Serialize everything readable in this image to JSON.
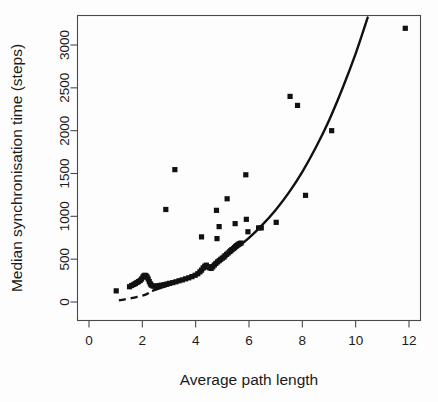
{
  "chart_data": {
    "type": "scatter",
    "title": "",
    "subtitle": "",
    "xlabel": "Average path length",
    "ylabel": "Median synchronisation time (steps)",
    "xlim": [
      0,
      12.6
    ],
    "ylim": [
      -60,
      3380
    ],
    "xticks": [
      0,
      2,
      4,
      6,
      8,
      10,
      12
    ],
    "xticklabels": [
      "0",
      "2",
      "4",
      "6",
      "8",
      "10",
      "12"
    ],
    "yticks": [
      0,
      500,
      1000,
      1500,
      2000,
      2500,
      3000
    ],
    "yticklabels": [
      "0",
      "500",
      "1000",
      "1500",
      "2000",
      "2500",
      "3000"
    ],
    "grid": false,
    "legend": null,
    "marker": "filled-square",
    "marker_color": "#111111",
    "series": [
      {
        "name": "networks",
        "marker": "filled-square",
        "points": [
          [
            1.02,
            130
          ],
          [
            1.52,
            178
          ],
          [
            1.6,
            193
          ],
          [
            1.68,
            205
          ],
          [
            1.74,
            216
          ],
          [
            1.8,
            228
          ],
          [
            1.86,
            238
          ],
          [
            1.92,
            252
          ],
          [
            1.97,
            268
          ],
          [
            2.02,
            290
          ],
          [
            2.06,
            305
          ],
          [
            2.1,
            312
          ],
          [
            2.14,
            305
          ],
          [
            2.18,
            292
          ],
          [
            2.22,
            268
          ],
          [
            2.26,
            238
          ],
          [
            2.3,
            212
          ],
          [
            2.34,
            196
          ],
          [
            2.4,
            186
          ],
          [
            2.48,
            184
          ],
          [
            2.56,
            188
          ],
          [
            2.64,
            192
          ],
          [
            2.72,
            196
          ],
          [
            2.82,
            202
          ],
          [
            2.92,
            210
          ],
          [
            3.02,
            218
          ],
          [
            3.14,
            226
          ],
          [
            3.26,
            236
          ],
          [
            3.38,
            248
          ],
          [
            3.5,
            258
          ],
          [
            3.62,
            270
          ],
          [
            3.74,
            282
          ],
          [
            3.86,
            296
          ],
          [
            3.98,
            312
          ],
          [
            4.08,
            330
          ],
          [
            4.16,
            352
          ],
          [
            4.22,
            372
          ],
          [
            4.28,
            398
          ],
          [
            4.34,
            418
          ],
          [
            4.4,
            430
          ],
          [
            4.46,
            412
          ],
          [
            4.52,
            400
          ],
          [
            4.58,
            392
          ],
          [
            4.64,
            410
          ],
          [
            4.7,
            432
          ],
          [
            4.76,
            450
          ],
          [
            4.82,
            468
          ],
          [
            4.88,
            482
          ],
          [
            4.94,
            498
          ],
          [
            5.0,
            512
          ],
          [
            5.06,
            524
          ],
          [
            5.1,
            540
          ],
          [
            5.16,
            556
          ],
          [
            5.22,
            572
          ],
          [
            5.28,
            588
          ],
          [
            5.32,
            600
          ],
          [
            5.36,
            612
          ],
          [
            5.42,
            624
          ],
          [
            5.46,
            636
          ],
          [
            5.5,
            648
          ],
          [
            5.54,
            658
          ],
          [
            5.58,
            668
          ],
          [
            5.62,
            676
          ],
          [
            5.66,
            682
          ],
          [
            5.7,
            688
          ],
          [
            2.88,
            1080
          ],
          [
            3.22,
            1545
          ],
          [
            4.22,
            760
          ],
          [
            4.78,
            1070
          ],
          [
            4.8,
            740
          ],
          [
            4.88,
            880
          ],
          [
            5.18,
            1205
          ],
          [
            5.48,
            915
          ],
          [
            5.88,
            1485
          ],
          [
            5.9,
            965
          ],
          [
            5.96,
            820
          ],
          [
            6.46,
            865
          ],
          [
            6.36,
            865
          ],
          [
            7.02,
            930
          ],
          [
            7.54,
            2400
          ],
          [
            7.82,
            2295
          ],
          [
            8.12,
            1245
          ],
          [
            9.1,
            2000
          ],
          [
            11.86,
            3195
          ]
        ]
      }
    ],
    "fit_curve": {
      "name": "fitted model",
      "style": "solid",
      "color": "#111111",
      "points": [
        [
          2.4,
          132
        ],
        [
          3.0,
          196
        ],
        [
          3.5,
          258
        ],
        [
          4.0,
          330
        ],
        [
          4.5,
          412
        ],
        [
          5.0,
          508
        ],
        [
          5.5,
          620
        ],
        [
          6.0,
          748
        ],
        [
          6.5,
          900
        ],
        [
          7.0,
          1075
        ],
        [
          7.5,
          1280
        ],
        [
          8.0,
          1520
        ],
        [
          8.5,
          1800
        ],
        [
          9.0,
          2120
        ],
        [
          9.5,
          2490
        ],
        [
          10.0,
          2900
        ],
        [
          10.45,
          3320
        ]
      ]
    },
    "fit_curve_dashed": {
      "name": "fitted model extrapolation",
      "style": "dashed",
      "color": "#111111",
      "points": [
        [
          1.12,
          18
        ],
        [
          1.4,
          34
        ],
        [
          1.7,
          52
        ],
        [
          2.0,
          74
        ],
        [
          2.2,
          98
        ],
        [
          2.4,
          132
        ]
      ]
    },
    "annotations": []
  },
  "figure": {
    "background_color": "#ffffff",
    "foreground_color": "#111111"
  }
}
